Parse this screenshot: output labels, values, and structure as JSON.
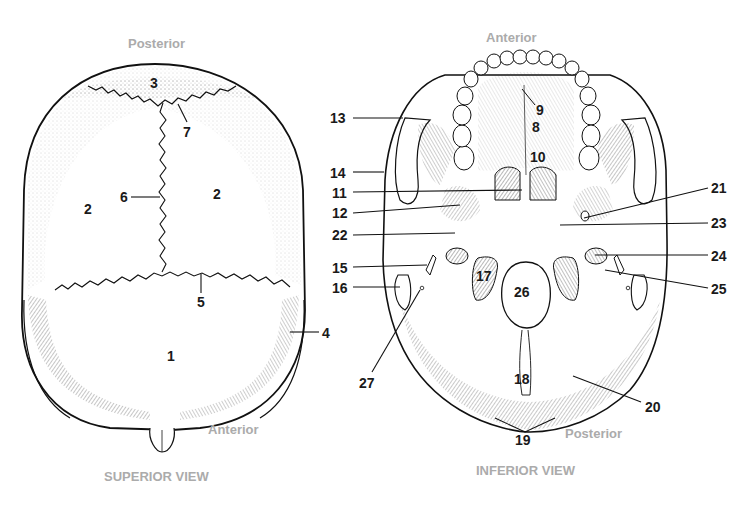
{
  "figure": {
    "superior_view": {
      "title": "SUPERIOR VIEW",
      "orientation_top": "Posterior",
      "orientation_bottom": "Anterior",
      "labels": [
        {
          "id": "1",
          "text": "1",
          "x": 167,
          "y": 349
        },
        {
          "id": "2L",
          "text": "2",
          "x": 84,
          "y": 202
        },
        {
          "id": "2R",
          "text": "2",
          "x": 213,
          "y": 187
        },
        {
          "id": "3",
          "text": "3",
          "x": 150,
          "y": 76
        },
        {
          "id": "4",
          "text": "4",
          "x": 322,
          "y": 326
        },
        {
          "id": "5",
          "text": "5",
          "x": 197,
          "y": 295
        },
        {
          "id": "6",
          "text": "6",
          "x": 120,
          "y": 190
        },
        {
          "id": "7",
          "text": "7",
          "x": 183,
          "y": 125
        }
      ]
    },
    "inferior_view": {
      "title": "INFERIOR VIEW",
      "orientation_top": "Anterior",
      "orientation_bottom": "Posterior",
      "labels": [
        {
          "id": "8",
          "text": "8",
          "x": 532,
          "y": 120
        },
        {
          "id": "9",
          "text": "9",
          "x": 536,
          "y": 103
        },
        {
          "id": "10",
          "text": "10",
          "x": 530,
          "y": 150
        },
        {
          "id": "11",
          "text": "11",
          "x": 332,
          "y": 186
        },
        {
          "id": "12",
          "text": "12",
          "x": 332,
          "y": 206
        },
        {
          "id": "13",
          "text": "13",
          "x": 330,
          "y": 111
        },
        {
          "id": "14",
          "text": "14",
          "x": 330,
          "y": 166
        },
        {
          "id": "15",
          "text": "15",
          "x": 332,
          "y": 261
        },
        {
          "id": "16",
          "text": "16",
          "x": 332,
          "y": 281
        },
        {
          "id": "17",
          "text": "17",
          "x": 476,
          "y": 269
        },
        {
          "id": "18",
          "text": "18",
          "x": 514,
          "y": 372
        },
        {
          "id": "19",
          "text": "19",
          "x": 515,
          "y": 433
        },
        {
          "id": "20",
          "text": "20",
          "x": 645,
          "y": 400
        },
        {
          "id": "21",
          "text": "21",
          "x": 711,
          "y": 181
        },
        {
          "id": "22",
          "text": "22",
          "x": 332,
          "y": 228
        },
        {
          "id": "23",
          "text": "23",
          "x": 711,
          "y": 216
        },
        {
          "id": "24",
          "text": "24",
          "x": 711,
          "y": 249
        },
        {
          "id": "25",
          "text": "25",
          "x": 711,
          "y": 282
        },
        {
          "id": "26",
          "text": "26",
          "x": 514,
          "y": 285
        },
        {
          "id": "27",
          "text": "27",
          "x": 359,
          "y": 376
        }
      ]
    },
    "colors": {
      "ink": "#1a1a1a",
      "caption_gray": "#ababab",
      "background": "#ffffff"
    }
  }
}
